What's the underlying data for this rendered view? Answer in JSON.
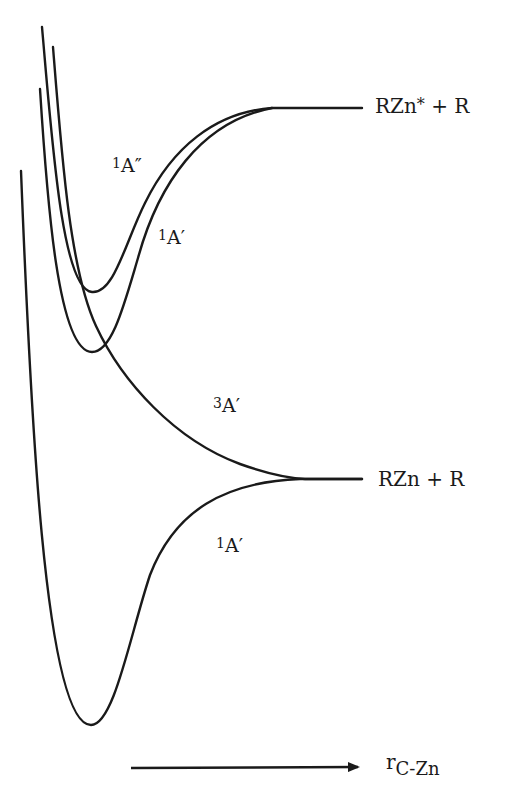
{
  "diagram": {
    "type": "potential energy curves",
    "curves": [
      {
        "id": "1A-double-prime",
        "state": "1A″",
        "multiplicity": "1",
        "symmetry": "A″",
        "dissociates_to": "RZn* + R",
        "shape": "bound, shallow well"
      },
      {
        "id": "1A-prime-upper",
        "state": "1A′",
        "multiplicity": "1",
        "symmetry": "A′",
        "dissociates_to": "RZn* + R",
        "shape": "bound, shallow well"
      },
      {
        "id": "3A-prime",
        "state": "3A′",
        "multiplicity": "3",
        "symmetry": "A′",
        "dissociates_to": "RZn + R",
        "shape": "repulsive"
      },
      {
        "id": "1A-prime-ground",
        "state": "1A′",
        "multiplicity": "1",
        "symmetry": "A′",
        "dissociates_to": "RZn + R",
        "shape": "bound, deep well"
      }
    ],
    "labels": {
      "a_double_prime": {
        "sup": "1",
        "base": "A″"
      },
      "a_prime_upper": {
        "sup": "1",
        "base": "A′"
      },
      "triplet": {
        "sup": "3",
        "base": "A′"
      },
      "a_prime_ground": {
        "sup": "1",
        "base": "A′"
      }
    },
    "asymptotes": {
      "upper": {
        "base": "RZn",
        "sup": "*",
        "rest": " + R"
      },
      "lower": {
        "text": "RZn + R"
      }
    },
    "axis": {
      "symbol": "r",
      "subscript": "C-Zn",
      "direction": "increasing to the right"
    }
  },
  "colors": {
    "line": "#1a1a1a",
    "background": "#ffffff"
  }
}
